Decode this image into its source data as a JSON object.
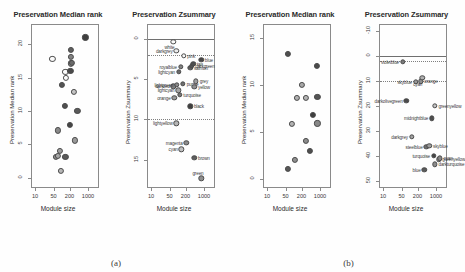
{
  "figure": {
    "panels": [
      {
        "id": "a",
        "caption": "(a)"
      },
      {
        "id": "b",
        "caption": "(b)"
      }
    ]
  },
  "chart_data": [
    {
      "panel": "a",
      "index": 0,
      "type": "scatter",
      "title": "Preservation Median rank",
      "xlabel": "Module size",
      "ylabel": "Preservation Median rank",
      "xscale": "log",
      "xticks": [
        10,
        50,
        200,
        1000
      ],
      "xticklabels": [
        "10",
        "50",
        "200",
        "1000"
      ],
      "xlim": [
        7,
        2600
      ],
      "yticks": [
        0,
        5,
        10,
        15,
        20
      ],
      "yticklabels": [
        "0",
        "5",
        "10",
        "15",
        "20"
      ],
      "ylim": [
        23,
        -1.5
      ],
      "grid": false,
      "points": [
        {
          "label": "lightyellow",
          "size": 95,
          "value": 1.0,
          "color": "#b7b7b7"
        },
        {
          "label": "orange",
          "size": 62,
          "value": 3.2,
          "color": "#8f8f8f"
        },
        {
          "label": "lightgreen",
          "size": 72,
          "value": 3.3,
          "color": "#a8a8a8"
        },
        {
          "label": "green",
          "size": 140,
          "value": 3.1,
          "color": "#5a5a5a"
        },
        {
          "label": "cyan",
          "size": 88,
          "value": 4.1,
          "color": "#9e9e9e"
        },
        {
          "label": "magenta",
          "size": 330,
          "value": 5.6,
          "color": "#9a9a9a"
        },
        {
          "label": "brown",
          "size": 75,
          "value": 7.1,
          "color": "#8a8a8a"
        },
        {
          "label": "black",
          "size": 205,
          "value": 7.9,
          "color": "#454545"
        },
        {
          "label": "yellow",
          "size": 400,
          "value": 10.0,
          "color": "#5a5a5a"
        },
        {
          "label": "greyish",
          "size": 130,
          "value": 10.8,
          "color": "#4f4f4f"
        },
        {
          "label": "salmon",
          "size": 300,
          "value": 12.9,
          "color": "#c4c4c4"
        },
        {
          "label": "lightcyan",
          "size": 105,
          "value": 13.9,
          "color": "#545454"
        },
        {
          "label": "royalblue",
          "size": 150,
          "value": 14.9,
          "color": "#fbfbfb"
        },
        {
          "label": "purple",
          "size": 140,
          "value": 15.9,
          "color": "#fbfbfb"
        },
        {
          "label": "blue",
          "size": 215,
          "value": 16.0,
          "color": "#4a4a4a"
        },
        {
          "label": "tan",
          "size": 230,
          "value": 17.1,
          "color": "#9e9e9e"
        },
        {
          "label": "pink",
          "size": 240,
          "value": 17.2,
          "color": "#6a6a6a"
        },
        {
          "label": "white",
          "size": 45,
          "value": 17.8,
          "color": "#fbfbfb"
        },
        {
          "label": "darkgreen",
          "size": 220,
          "value": 18.1,
          "color": "#828282"
        },
        {
          "label": "grey60",
          "size": 230,
          "value": 19.1,
          "color": "#5e5e5e"
        },
        {
          "label": "turquoise",
          "size": 800,
          "value": 21.0,
          "color": "#3f3f3f"
        }
      ]
    },
    {
      "panel": "a",
      "index": 1,
      "type": "scatter",
      "title": "Preservation Zsummary",
      "xlabel": "Module size",
      "ylabel": "Preservation Zsummary",
      "xscale": "log",
      "xticks": [
        10,
        50,
        200,
        1000
      ],
      "xticklabels": [
        "10",
        "50",
        "200",
        "1000"
      ],
      "xlim": [
        7,
        2600
      ],
      "yticks": [
        0,
        5,
        10,
        15
      ],
      "yticklabels": [
        "0",
        "5",
        "10",
        "15"
      ],
      "ylim": [
        -1.8,
        18.5
      ],
      "hlines": [
        {
          "value": 10,
          "style": "dotted"
        },
        {
          "value": 2,
          "style": "dotted"
        },
        {
          "value": 0,
          "style": "solid"
        }
      ],
      "points": [
        {
          "label": "green",
          "size": 800,
          "value": 17.3,
          "color": "#8e8e8e",
          "lpos": "above"
        },
        {
          "label": "brown",
          "size": 430,
          "value": 14.8,
          "color": "#5e5e5e",
          "lpos": "right"
        },
        {
          "label": "cyan",
          "size": 140,
          "value": 13.7,
          "color": "#c0c0c0",
          "lpos": "left"
        },
        {
          "label": "magenta",
          "size": 215,
          "value": 12.9,
          "color": "#8d8d8d",
          "lpos": "left"
        },
        {
          "label": "lightyellow",
          "size": 90,
          "value": 10.5,
          "color": "#b4b4b4",
          "lpos": "left"
        },
        {
          "label": "black",
          "size": 300,
          "value": 8.4,
          "color": "#3f3f3f",
          "lpos": "right"
        },
        {
          "label": "orange",
          "size": 75,
          "value": 7.3,
          "color": "#9a9a9a",
          "lpos": "left"
        },
        {
          "label": "turquoise",
          "size": 120,
          "value": 7.0,
          "color": "#787878",
          "lpos": "right"
        },
        {
          "label": "lightcyan2",
          "size": 105,
          "value": 6.4,
          "color": "#a6a6a6",
          "lpos": "left"
        },
        {
          "label": "darkred",
          "size": 70,
          "value": 5.9,
          "color": "#7d7d7d",
          "lpos": "left"
        },
        {
          "label": "lightgreen",
          "size": 95,
          "value": 5.7,
          "color": "#8a8a8a",
          "lpos": "left"
        },
        {
          "label": "purple",
          "size": 160,
          "value": 5.6,
          "color": "#6f6f6f",
          "lpos": "right"
        },
        {
          "label": "yellow",
          "size": 430,
          "value": 6.0,
          "color": "#919191",
          "lpos": "right"
        },
        {
          "label": "grey60",
          "size": 500,
          "value": 5.3,
          "color": "#a0a0a0",
          "lpos": "right"
        },
        {
          "label": "lightcyan",
          "size": 110,
          "value": 4.1,
          "color": "#6a6a6a",
          "lpos": "left"
        },
        {
          "label": "royalblue",
          "size": 130,
          "value": 3.5,
          "color": "#828282",
          "lpos": "left"
        },
        {
          "label": "salmon",
          "size": 300,
          "value": 3.6,
          "color": "#5c5c5c",
          "lpos": "right"
        },
        {
          "label": "darkgreen",
          "size": 340,
          "value": 3.4,
          "color": "#555555",
          "lpos": "right"
        },
        {
          "label": "tan",
          "size": 390,
          "value": 3.1,
          "color": "#4e4e4e",
          "lpos": "right"
        },
        {
          "label": "blue",
          "size": 780,
          "value": 2.6,
          "color": "#464646",
          "lpos": "right"
        },
        {
          "label": "pink",
          "size": 170,
          "value": 2.1,
          "color": "#f7f7f7",
          "lpos": "right"
        },
        {
          "label": "darkgrey",
          "size": 90,
          "value": 1.5,
          "color": "#ececec",
          "lpos": "left"
        },
        {
          "label": "white",
          "size": 70,
          "value": 0.4,
          "color": "#fbfbfb",
          "lpos": "below"
        }
      ]
    },
    {
      "panel": "b",
      "index": 0,
      "type": "scatter",
      "title": "Preservation Median rank",
      "xlabel": "Module size",
      "ylabel": "Preservation Median rank",
      "xscale": "log",
      "xticks": [
        10,
        50,
        200,
        1000
      ],
      "xticklabels": [
        "10",
        "50",
        "200",
        "1000"
      ],
      "xlim": [
        7,
        2600
      ],
      "yticks": [
        0,
        5,
        10,
        15
      ],
      "yticklabels": [
        "0",
        "5",
        "10",
        "15"
      ],
      "ylim": [
        16.5,
        -1.0
      ],
      "grid": false,
      "points": [
        {
          "label": "blue",
          "size": 60,
          "value": 1.0,
          "color": "#575757"
        },
        {
          "label": "darkturquoise",
          "size": 110,
          "value": 2.0,
          "color": "#8f8f8f"
        },
        {
          "label": "greenyellow",
          "size": 420,
          "value": 3.0,
          "color": "#4e4e4e"
        },
        {
          "label": "turquoise",
          "size": 290,
          "value": 4.0,
          "color": "#8c8c8c"
        },
        {
          "label": "darkgrey",
          "size": 85,
          "value": 5.8,
          "color": "#b2b2b2"
        },
        {
          "label": "midnightblue",
          "size": 800,
          "value": 5.9,
          "color": "#888888"
        },
        {
          "label": "darkolivegreen",
          "size": 520,
          "value": 6.8,
          "color": "#3f3f3f"
        },
        {
          "label": "skyblue",
          "size": 130,
          "value": 8.6,
          "color": "#b0b0b0"
        },
        {
          "label": "steelblue",
          "size": 300,
          "value": 8.6,
          "color": "#b4b4b4"
        },
        {
          "label": "cyan",
          "size": 800,
          "value": 8.7,
          "color": "#555555"
        },
        {
          "label": "orange",
          "size": 200,
          "value": 10.0,
          "color": "#a8a8a8"
        },
        {
          "label": "violetblue",
          "size": 760,
          "value": 12.0,
          "color": "#4a4a4a"
        },
        {
          "label": "lightblue",
          "size": 62,
          "value": 13.3,
          "color": "#4f4f4f"
        }
      ]
    },
    {
      "panel": "b",
      "index": 1,
      "type": "scatter",
      "title": "Preservation Zsummary",
      "xlabel": "Module size",
      "ylabel": "Preservation Zsummary",
      "xscale": "log",
      "xticks": [
        10,
        50,
        200,
        1000
      ],
      "xticklabels": [
        "10",
        "50",
        "200",
        "1000"
      ],
      "xlim": [
        7,
        2600
      ],
      "yticks": [
        -10,
        0,
        10,
        20,
        30,
        40,
        50
      ],
      "yticklabels": [
        "-10",
        "0",
        "10",
        "20",
        "30",
        "40",
        "50"
      ],
      "ylim": [
        -13,
        53
      ],
      "hlines": [
        {
          "value": 10,
          "style": "dotted"
        },
        {
          "value": 2,
          "style": "dotted"
        },
        {
          "value": 0,
          "style": "solid"
        }
      ],
      "points": [
        {
          "label": "blue",
          "size": 360,
          "value": 45.8,
          "color": "#5a5a5a",
          "lpos": "left"
        },
        {
          "label": "darkturquoise",
          "size": 900,
          "value": 43.5,
          "color": "#8c8c8c",
          "lpos": "right"
        },
        {
          "label": "greenyellow",
          "size": 1250,
          "value": 41.5,
          "color": "#9a9a9a",
          "lpos": "right"
        },
        {
          "label": "turquoise",
          "size": 820,
          "value": 40.0,
          "color": "#454545",
          "lpos": "left"
        },
        {
          "label": "cyan",
          "size": 1400,
          "value": 41.0,
          "color": "#888888",
          "lpos": "right"
        },
        {
          "label": "steelblue",
          "size": 430,
          "value": 36.5,
          "color": "#6e6e6e",
          "lpos": "left"
        },
        {
          "label": "skyblue",
          "size": 560,
          "value": 36.0,
          "color": "#9e9e9e",
          "lpos": "right"
        },
        {
          "label": "darkgrey",
          "size": 120,
          "value": 32.5,
          "color": "#a2a2a2",
          "lpos": "left"
        },
        {
          "label": "midnightblue",
          "size": 700,
          "value": 25.0,
          "color": "#4e4e4e",
          "lpos": "left"
        },
        {
          "label": "greenyellow2",
          "size": 900,
          "value": 20.0,
          "color": "#c2c2c2",
          "lpos": "right"
        },
        {
          "label": "darkolivegreen",
          "size": 75,
          "value": 17.8,
          "color": "#4a4a4a",
          "lpos": "left"
        },
        {
          "label": "skyblue3",
          "size": 170,
          "value": 10.3,
          "color": "#9a9a9a",
          "lpos": "left"
        },
        {
          "label": "orange",
          "size": 260,
          "value": 10.0,
          "color": "#8e8e8e",
          "lpos": "right"
        },
        {
          "label": "cyan2",
          "size": 300,
          "value": 8.7,
          "color": "#b0b0b0",
          "lpos": "below"
        },
        {
          "label": "violetblue",
          "size": 55,
          "value": 2.2,
          "color": "#7a7a7a",
          "lpos": "left"
        }
      ]
    }
  ]
}
